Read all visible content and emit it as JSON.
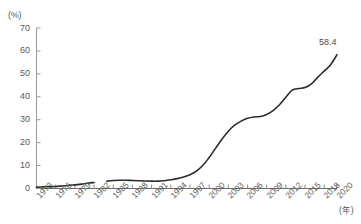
{
  "chart_data": {
    "type": "line",
    "title": "",
    "subtitle": "",
    "xlabel": "(年)",
    "ylabel": "(%)",
    "ylim": [
      0,
      70
    ],
    "xlim": [
      1973,
      2020
    ],
    "yticks": [
      0,
      10,
      20,
      30,
      40,
      50,
      60,
      70
    ],
    "ytick_labels": [
      "0",
      "10",
      "20",
      "30",
      "40",
      "50",
      "60",
      "70"
    ],
    "xticks": [
      1973,
      1976,
      1979,
      1982,
      1985,
      1988,
      1991,
      1994,
      1997,
      2000,
      2003,
      2006,
      2009,
      2012,
      2015,
      2018,
      2020
    ],
    "xtick_labels": [
      "1973",
      "1976",
      "1979",
      "1982",
      "1985",
      "1988",
      "1991",
      "1994",
      "1997",
      "2000",
      "2003",
      "2006",
      "2009",
      "2012",
      "2015",
      "2018",
      "2020"
    ],
    "grid": false,
    "legend": false,
    "legend_position": "none",
    "line_color": "#2b2b2b",
    "line_width": 1.6,
    "annotations": [
      {
        "name": "final-value",
        "text": "58.4",
        "x": 2020,
        "y": 58.4
      }
    ],
    "series": [
      {
        "name": "series-1",
        "segments": [
          {
            "name": "segment-early",
            "x": [
              1973,
              1974,
              1975,
              1976,
              1977,
              1978,
              1979,
              1980,
              1981,
              1982
            ],
            "values": [
              0.6,
              0.7,
              0.8,
              0.9,
              1.1,
              1.3,
              1.6,
              1.9,
              2.3,
              2.6
            ]
          },
          {
            "name": "segment-main",
            "x": [
              1984,
              1985,
              1986,
              1987,
              1988,
              1989,
              1990,
              1991,
              1992,
              1993,
              1994,
              1995,
              1996,
              1997,
              1998,
              1999,
              2000,
              2001,
              2002,
              2003,
              2004,
              2005,
              2006,
              2007,
              2008,
              2009,
              2010,
              2011,
              2012,
              2013,
              2014,
              2015,
              2016,
              2017,
              2018,
              2019,
              2020
            ],
            "values": [
              3.2,
              3.5,
              3.6,
              3.6,
              3.5,
              3.4,
              3.3,
              3.2,
              3.2,
              3.4,
              3.8,
              4.3,
              5.0,
              6.0,
              7.6,
              10.0,
              13.5,
              17.5,
              21.5,
              25.0,
              27.6,
              29.4,
              30.6,
              31.2,
              31.4,
              32.3,
              34.0,
              36.5,
              39.8,
              42.9,
              43.6,
              44.0,
              45.6,
              48.6,
              51.2,
              54.0,
              58.4
            ]
          }
        ]
      }
    ]
  },
  "axes": {
    "y_unit_label": "(%)",
    "x_unit_label": "(年)"
  },
  "cut_off_header": "　　　　　　　　　　　　　　　　　"
}
